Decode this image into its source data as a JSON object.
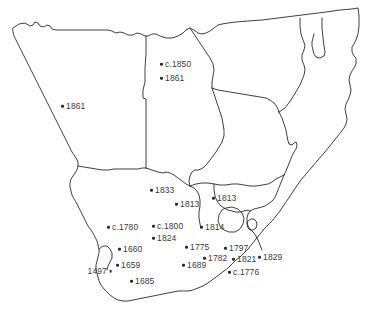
{
  "map": {
    "title": "Southern Africa historical dates map",
    "region": "Southern Africa",
    "stroke_color": "#2a2a2a",
    "text_color": "#3b3b3b",
    "background_color": "#ffffff",
    "width": 384,
    "height": 312
  },
  "markers": [
    {
      "label": "c.1850",
      "x": 160,
      "y": 64,
      "side": "right"
    },
    {
      "label": "1861",
      "x": 160,
      "y": 78,
      "side": "right"
    },
    {
      "label": "1861",
      "x": 61,
      "y": 106,
      "side": "right"
    },
    {
      "label": "1833",
      "x": 150,
      "y": 190,
      "side": "right"
    },
    {
      "label": "1813",
      "x": 175,
      "y": 204,
      "side": "right"
    },
    {
      "label": "1813",
      "x": 212,
      "y": 198,
      "side": "right"
    },
    {
      "label": "c.1780",
      "x": 107,
      "y": 227,
      "side": "right"
    },
    {
      "label": "c.1800",
      "x": 152,
      "y": 226,
      "side": "right"
    },
    {
      "label": "1824",
      "x": 152,
      "y": 238,
      "side": "right"
    },
    {
      "label": "1814",
      "x": 200,
      "y": 227,
      "side": "right"
    },
    {
      "label": "1660",
      "x": 118,
      "y": 249,
      "side": "right"
    },
    {
      "label": "1775",
      "x": 185,
      "y": 247,
      "side": "right"
    },
    {
      "label": "1797",
      "x": 224,
      "y": 248,
      "side": "right"
    },
    {
      "label": "1782",
      "x": 203,
      "y": 258,
      "side": "right"
    },
    {
      "label": "1821",
      "x": 232,
      "y": 259,
      "side": "right"
    },
    {
      "label": "1829",
      "x": 258,
      "y": 257,
      "side": "right"
    },
    {
      "label": "1659",
      "x": 116,
      "y": 265,
      "side": "right"
    },
    {
      "label": "1689",
      "x": 182,
      "y": 265,
      "side": "right"
    },
    {
      "label": "1497",
      "x": 112,
      "y": 271,
      "side": "left"
    },
    {
      "label": "c.1776",
      "x": 228,
      "y": 272,
      "side": "right"
    },
    {
      "label": "1685",
      "x": 130,
      "y": 281,
      "side": "right"
    }
  ]
}
